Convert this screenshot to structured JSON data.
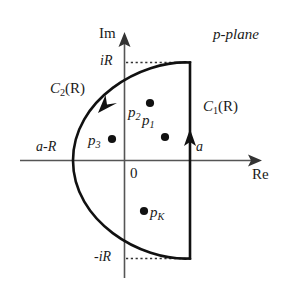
{
  "figure": {
    "domain_label": "p-plane",
    "axes": {
      "imaginary_label": "Im",
      "real_label": "Re",
      "origin_label": "0"
    },
    "tick_labels": {
      "top": "iR",
      "bottom": "-iR",
      "left": "a-R",
      "right": "a"
    },
    "contours": [
      {
        "name": "vertical-line-contour",
        "label_base": "C",
        "label_index": "1",
        "label_arg": "(R)",
        "full": "C1(R)"
      },
      {
        "name": "arc-contour",
        "label_base": "C",
        "label_index": "2",
        "label_arg": "(R)",
        "full": "C2(R)"
      }
    ],
    "poles": [
      {
        "name": "pole-p1",
        "base": "p",
        "index": "1",
        "x": 165,
        "y": 137,
        "label_dx": -23,
        "label_dy": -22
      },
      {
        "name": "pole-p2",
        "base": "p",
        "index": "2",
        "x": 150,
        "y": 103,
        "label_dx": -22,
        "label_dy": 4
      },
      {
        "name": "pole-p3",
        "base": "p",
        "index": "3",
        "x": 112,
        "y": 139,
        "label_dx": -24,
        "label_dy": -6
      },
      {
        "name": "pole-pK",
        "base": "p",
        "index": "K",
        "x": 144,
        "y": 211,
        "label_dx": 5,
        "label_dy": -6
      }
    ],
    "colors": {
      "contour": "#111111",
      "axis": "#555555",
      "dotted": "#333333",
      "background": "#ffffff"
    }
  }
}
